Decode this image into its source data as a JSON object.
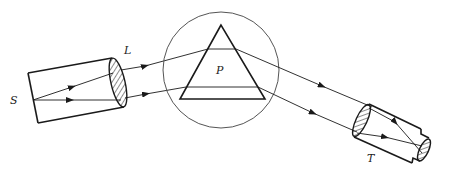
{
  "diagram": {
    "labels": {
      "source": "S",
      "lens": "L",
      "prism": "P",
      "telescope": "T"
    },
    "colors": {
      "stroke": "#1a1a1a",
      "circle": "#555555",
      "background": "#ffffff"
    },
    "components": [
      {
        "id": "collimator",
        "label": "S",
        "description": "collimator tube with slit source S"
      },
      {
        "id": "lens",
        "label": "L",
        "description": "collimating lens (hatched)"
      },
      {
        "id": "prism",
        "label": "P",
        "description": "triangular prism on circular table"
      },
      {
        "id": "telescope",
        "label": "T",
        "description": "telescope with objective and eyepiece"
      }
    ]
  }
}
